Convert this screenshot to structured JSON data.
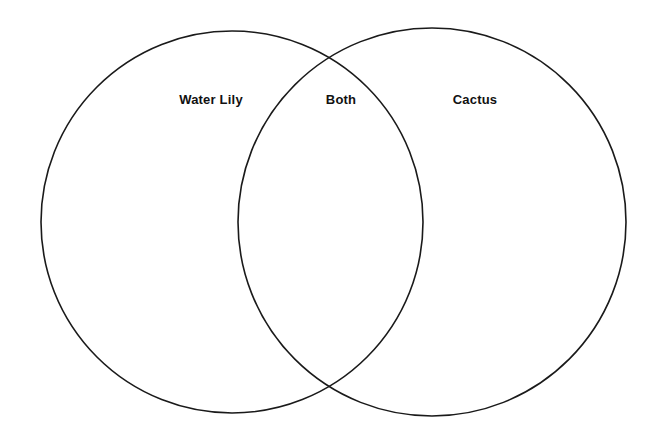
{
  "diagram": {
    "type": "venn-two-circle",
    "background_color": "#ffffff",
    "stroke_color": "#1a1a1a",
    "fill": "none",
    "labels": {
      "left": "Water Lily",
      "overlap": "Both",
      "right": "Cactus"
    },
    "circles": [
      {
        "name": "left-circle",
        "label": "Water Lily",
        "center_x": 232,
        "center_y": 222,
        "radius": 191,
        "stroke_width": 1.6
      },
      {
        "name": "right-circle",
        "label": "Cactus",
        "center_x": 432,
        "center_y": 222,
        "radius": 194,
        "stroke_width": 1.6
      }
    ],
    "intersection_points": [
      {
        "x": 340,
        "y": 51
      },
      {
        "x": 340,
        "y": 391
      }
    ],
    "label_positions": [
      {
        "name": "left-label",
        "x": 211,
        "y": 99
      },
      {
        "name": "overlap-label",
        "x": 341,
        "y": 99
      },
      {
        "name": "right-label",
        "x": 475,
        "y": 99
      }
    ]
  }
}
